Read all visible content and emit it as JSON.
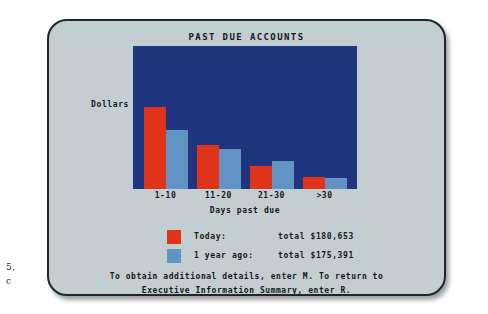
{
  "margin_notes": [
    "5,",
    "c"
  ],
  "chart_data": {
    "type": "bar",
    "title": "PAST DUE ACCOUNTS",
    "xlabel": "Days past due",
    "ylabel": "Dollars",
    "categories": [
      "1-10",
      "11-20",
      "21-30",
      ">30"
    ],
    "series": [
      {
        "name": "Today",
        "color": "#e0341a",
        "values": [
          84000,
          45000,
          24000,
          13000
        ],
        "pixel_heights": [
          82,
          44,
          23,
          12
        ]
      },
      {
        "name": "1 year ago",
        "color": "#6392c4",
        "values": [
          60000,
          41000,
          29000,
          12000
        ],
        "pixel_heights": [
          59,
          40,
          28,
          11
        ]
      }
    ],
    "ylim": [
      0,
      100000
    ],
    "grid": false,
    "legend_position": "below",
    "plot_background": "#1f357f"
  },
  "legend": {
    "rows": [
      {
        "name": "Today:",
        "total": "total $180,653",
        "swatch": "today-swatch"
      },
      {
        "name": "1 year ago:",
        "total": "total $175,391",
        "swatch": "one-year-ago-swatch"
      }
    ]
  },
  "footer": {
    "line1": "To obtain additional details, enter M. To return to",
    "line2": "Executive Information Summary, enter R."
  },
  "colors": {
    "card_background": "#c3ced0",
    "plot_background": "#1f357f",
    "today_bar": "#e0341a",
    "year_ago_bar": "#6392c4",
    "text": "#15181c"
  }
}
